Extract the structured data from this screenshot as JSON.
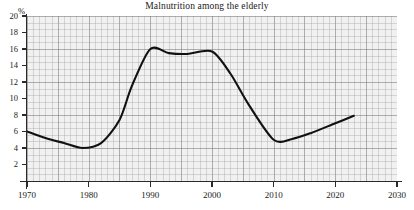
{
  "chart_data": {
    "type": "line",
    "title": "Malnutrition among the elderly",
    "xlabel": "",
    "ylabel": "%",
    "y_unit": "%",
    "xlim": [
      1970,
      2030
    ],
    "ylim": [
      0,
      20
    ],
    "grid": true,
    "legend": null,
    "xticks": [
      1970,
      1980,
      1990,
      2000,
      2010,
      2020,
      2030
    ],
    "yticks": [
      2,
      4,
      6,
      8,
      10,
      12,
      14,
      16,
      18,
      20
    ],
    "line_color": "#111111",
    "plot_background": "#f1f1f1",
    "series": [
      {
        "name": "Malnutrition among the elderly",
        "x": [
          1970,
          1973,
          1976,
          1979,
          1982,
          1985,
          1987,
          1990,
          1993,
          1996,
          2000,
          2003,
          2006,
          2010,
          2013,
          2016,
          2020,
          2023
        ],
        "values": [
          6.0,
          5.2,
          4.6,
          4.0,
          4.6,
          7.4,
          11.5,
          16.0,
          15.5,
          15.4,
          15.7,
          13.0,
          9.2,
          5.0,
          5.1,
          5.8,
          7.0,
          7.9
        ]
      }
    ]
  },
  "axis": {
    "y_tick_labels": [
      "20",
      "18",
      "16",
      "14",
      "12",
      "10",
      "8",
      "6",
      "4",
      "2"
    ],
    "x_tick_labels": [
      "1970",
      "1980",
      "1990",
      "2000",
      "2010",
      "2020",
      "2030"
    ]
  }
}
